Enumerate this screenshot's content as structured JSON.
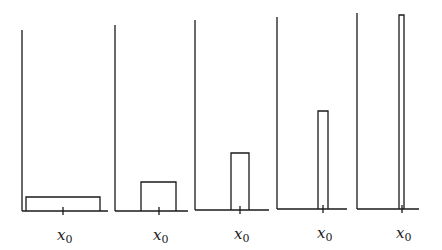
{
  "figure": {
    "tick_label": "x",
    "tick_subscript": "0",
    "panels": [
      {
        "axis_x": 22,
        "axis_top": 30,
        "baseline": 211,
        "base_end": 108,
        "rect_left": 26,
        "rect_right": 100,
        "rect_top": 197,
        "tick_x": 63
      },
      {
        "axis_x": 115,
        "axis_top": 25,
        "baseline": 211,
        "base_end": 188,
        "rect_left": 141,
        "rect_right": 176,
        "rect_top": 182,
        "tick_x": 159
      },
      {
        "axis_x": 195,
        "axis_top": 20,
        "baseline": 210,
        "base_end": 269,
        "rect_left": 231,
        "rect_right": 249,
        "rect_top": 153,
        "tick_x": 240
      },
      {
        "axis_x": 277,
        "axis_top": 17,
        "baseline": 209,
        "base_end": 347,
        "rect_left": 318,
        "rect_right": 328,
        "rect_top": 111,
        "tick_x": 323
      },
      {
        "axis_x": 357,
        "axis_top": 13,
        "baseline": 209,
        "base_end": 419,
        "rect_left": 399,
        "rect_right": 404,
        "rect_top": 15,
        "tick_x": 402
      }
    ]
  }
}
